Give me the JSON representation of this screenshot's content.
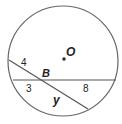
{
  "diagram": {
    "type": "circle-intersecting-chords",
    "center_label": "O",
    "intersection_label": "B",
    "segments": [
      {
        "label": "4",
        "description": "upper-left part of diagonal chord"
      },
      {
        "label": "y",
        "description": "lower-right part of diagonal chord"
      },
      {
        "label": "3",
        "description": "left part of horizontal chord"
      },
      {
        "label": "8",
        "description": "right part of horizontal chord"
      }
    ],
    "colors": {
      "stroke": "#555555",
      "text": "#222222",
      "background": "#ffffff"
    }
  }
}
